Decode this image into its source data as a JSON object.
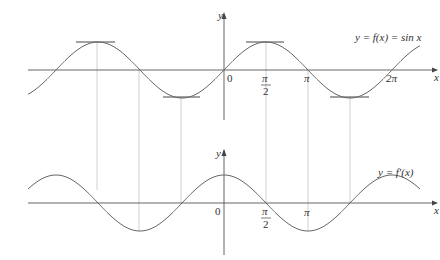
{
  "top_graph": {
    "equation_label": "y = f(x) = sin x",
    "y_axis_label": "y",
    "x_axis_label": "x",
    "origin_label": "0",
    "tick_labels": {
      "pi_over_2_num": "π",
      "pi_over_2_den": "2",
      "pi": "π",
      "two_pi": "2π"
    }
  },
  "bottom_graph": {
    "equation_label": "y = f′(x)",
    "y_axis_label": "y",
    "x_axis_label": "x",
    "origin_label": "0",
    "tick_labels": {
      "pi_over_2_num": "π",
      "pi_over_2_den": "2",
      "pi": "π"
    }
  },
  "colors": {
    "curve": "#666666",
    "axis": "#555555",
    "guide": "#bbbbbb",
    "tangent": "#444444"
  }
}
